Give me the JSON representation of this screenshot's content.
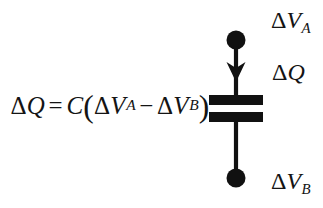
{
  "figure": {
    "name": "capacitor-charge-diagram",
    "background_color": "#ffffff",
    "ink_color": "#141414"
  },
  "equation": {
    "full_text": "ΔQ = C(ΔV_A − ΔV_B)",
    "lhs_delta": "Δ",
    "lhs_symbol": "Q",
    "equals": "=",
    "capacitance_symbol": "C",
    "open_paren": "(",
    "term1_delta": "Δ",
    "term1_symbol": "V",
    "term1_subscript": "A",
    "minus": "−",
    "term2_delta": "Δ",
    "term2_symbol": "V",
    "term2_subscript": "B",
    "close_paren": ")"
  },
  "schematic": {
    "type": "capacitor",
    "top_node": "filled-circle-terminal",
    "bottom_node": "filled-circle-terminal",
    "current_arrow_direction": "down",
    "plate_count": 2,
    "wire_color": "#111111",
    "plate_color": "#111111"
  },
  "labels": {
    "top": {
      "delta": "Δ",
      "symbol": "V",
      "subscript": "A",
      "text": "ΔV_A"
    },
    "middle": {
      "delta": "Δ",
      "symbol": "Q",
      "subscript": "",
      "text": "ΔQ"
    },
    "bottom": {
      "delta": "Δ",
      "symbol": "V",
      "subscript": "B",
      "text": "ΔV_B"
    }
  }
}
